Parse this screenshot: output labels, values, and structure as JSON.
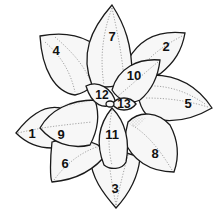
{
  "diagram": {
    "type": "leaf-rosette",
    "leaves": [
      {
        "number": "1",
        "x": 32,
        "y": 133
      },
      {
        "number": "2",
        "x": 166,
        "y": 46
      },
      {
        "number": "3",
        "x": 115,
        "y": 188
      },
      {
        "number": "4",
        "x": 56,
        "y": 50
      },
      {
        "number": "5",
        "x": 188,
        "y": 103
      },
      {
        "number": "6",
        "x": 65,
        "y": 163
      },
      {
        "number": "7",
        "x": 112,
        "y": 36
      },
      {
        "number": "8",
        "x": 155,
        "y": 153
      },
      {
        "number": "9",
        "x": 61,
        "y": 134
      },
      {
        "number": "10",
        "x": 134,
        "y": 75
      },
      {
        "number": "11",
        "x": 112,
        "y": 134
      },
      {
        "number": "12",
        "x": 102,
        "y": 95
      },
      {
        "number": "13",
        "x": 122,
        "y": 104
      }
    ]
  }
}
